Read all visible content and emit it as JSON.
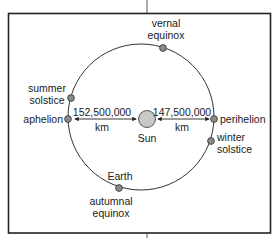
{
  "diagram": {
    "colors": {
      "frame": "#222222",
      "orbit": "#333333",
      "sun_fill": "#c8c8c8",
      "planet_fill": "#8a8a8a",
      "text": "#1a1a1a"
    },
    "sun": {
      "label": "Sun"
    },
    "distances": {
      "aphelion": {
        "value": "152,500,000",
        "unit": "km"
      },
      "perihelion": {
        "value": "147,500,000",
        "unit": "km"
      }
    },
    "positions": [
      {
        "id": "vernal-equinox",
        "line1": "vernal",
        "line2": "equinox"
      },
      {
        "id": "summer-solstice",
        "line1": "summer",
        "line2": "solstice"
      },
      {
        "id": "aphelion",
        "line1": "aphelion",
        "line2": ""
      },
      {
        "id": "perihelion",
        "line1": "perihelion",
        "line2": ""
      },
      {
        "id": "winter-solstice",
        "line1": "winter",
        "line2": "solstice"
      },
      {
        "id": "earth",
        "line1": "Earth",
        "line2": ""
      },
      {
        "id": "autumnal-equinox",
        "line1": "autumnal",
        "line2": "equinox"
      }
    ]
  }
}
